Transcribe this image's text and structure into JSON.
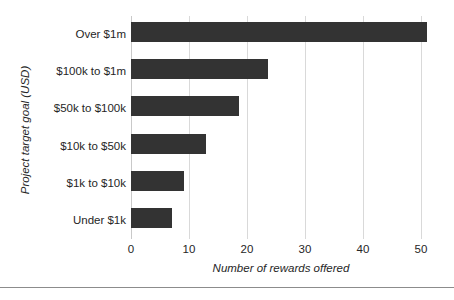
{
  "chart_data": {
    "type": "bar",
    "orientation": "horizontal",
    "title": "",
    "xlabel": "Number of rewards offered",
    "ylabel": "Project target goal (USD)",
    "categories": [
      "Over $1m",
      "$100k to $1m",
      "$50k to $100k",
      "$10k to $50k",
      "$1k to $10k",
      "Under $1k"
    ],
    "values": [
      51,
      23.6,
      18.6,
      13,
      9.2,
      7.1
    ],
    "xlim": [
      0,
      52
    ],
    "xticks": [
      0,
      10,
      20,
      30,
      40,
      50
    ],
    "xtick_labels": [
      "0",
      "10",
      "20",
      "30",
      "40",
      "50"
    ],
    "grid": "vertical",
    "legend": "none",
    "bar_color": "#333333",
    "gridline_color": "#d9d9d9",
    "text_color": "#262626"
  }
}
